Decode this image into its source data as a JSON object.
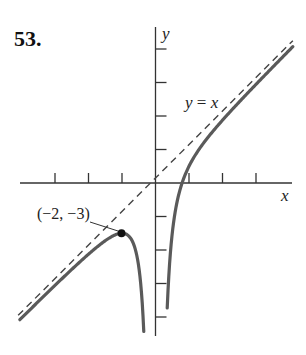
{
  "problem_number": "53.",
  "chart_data": {
    "type": "line",
    "title": "",
    "function": "y = x - 4/x^2",
    "xlabel": "x",
    "ylabel": "y",
    "xlim": [
      -8,
      8
    ],
    "ylim": [
      -9,
      9.3
    ],
    "x_ticks": [
      -6,
      -4,
      -2,
      2,
      4,
      6
    ],
    "y_ticks": [
      -8,
      -6,
      -4,
      -2,
      2,
      4,
      6,
      8
    ],
    "tick_labels_shown": false,
    "grid": false,
    "legend": null,
    "series": [
      {
        "name": "y = f(x) left branch",
        "style": "solid",
        "points": [
          [
            -8.1,
            -8.16
          ],
          [
            -6,
            -6.11
          ],
          [
            -4,
            -4.25
          ],
          [
            -3,
            -3.44
          ],
          [
            -2,
            -3
          ],
          [
            -1.5,
            -3.28
          ],
          [
            -1,
            -5
          ],
          [
            -0.8,
            -7.05
          ],
          [
            -0.7,
            -8.86
          ]
        ]
      },
      {
        "name": "y = f(x) right branch",
        "style": "solid",
        "points": [
          [
            0.7,
            -7.46
          ],
          [
            0.8,
            -5.45
          ],
          [
            1,
            -3
          ],
          [
            1.2,
            -1.58
          ],
          [
            1.587,
            0
          ],
          [
            2,
            1
          ],
          [
            3,
            2.56
          ],
          [
            4,
            3.75
          ],
          [
            6,
            5.89
          ],
          [
            8.2,
            8.14
          ]
        ]
      },
      {
        "name": "y = x (asymptote)",
        "style": "dashed",
        "points": [
          [
            -8.2,
            -8.2
          ],
          [
            8.2,
            8.2
          ]
        ]
      }
    ],
    "annotations": [
      {
        "text": "(−2, −3)",
        "point": [
          -2,
          -3
        ],
        "marker": "filled-dot"
      },
      {
        "text": "y = x",
        "target": "asymptote"
      }
    ],
    "asymptotes": {
      "vertical": "x = 0",
      "slant": "y = x"
    }
  },
  "labels": {
    "x_axis": "x",
    "y_axis": "y",
    "asymptote_lhs": "y",
    "asymptote_eq": " = ",
    "asymptote_rhs": "x",
    "point": "(−2, −3)"
  },
  "colors": {
    "axis": "#333333",
    "curve": "#5a5a5a",
    "dashed": "#444444",
    "point": "#111111"
  }
}
